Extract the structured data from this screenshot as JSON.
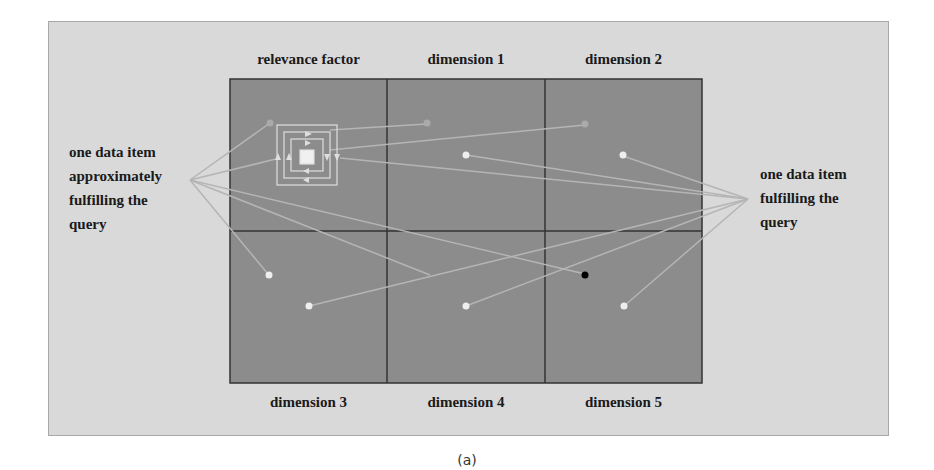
{
  "figure": {
    "caption": "(a)",
    "top_labels": [
      "relevance factor",
      "dimension 1",
      "dimension 2"
    ],
    "bottom_labels": [
      "dimension 3",
      "dimension 4",
      "dimension 5"
    ],
    "left_annotation": [
      "one data item",
      "approximately",
      "fulfilling the",
      "query"
    ],
    "right_annotation": [
      "one data item",
      "fulfilling the",
      "query"
    ],
    "colors": {
      "background": "#d9d9d9",
      "cell": "#8c8c8c",
      "grid_line": "#333333",
      "point": "#eeeeee",
      "query_point": "#000000",
      "connector": "#b5b5b5"
    }
  }
}
